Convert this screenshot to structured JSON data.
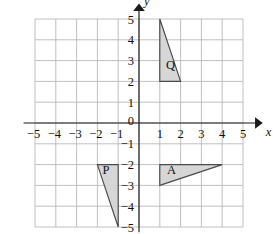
{
  "figure": {
    "kind": "coordinate-plane",
    "background_color": "#ffffff",
    "grid_color": "#b9b9bc",
    "axis_color": "#1b1b1b",
    "shape_fill_color": "#d3d3d3",
    "shape_stroke_color": "#4a4a4a"
  },
  "axes": {
    "x_axis_name": "x",
    "y_axis_name": "y",
    "origin_label": "0",
    "x_ticks": [
      {
        "value": -5,
        "label": "−5"
      },
      {
        "value": -4,
        "label": "−4"
      },
      {
        "value": -3,
        "label": "−3"
      },
      {
        "value": -2,
        "label": "−2"
      },
      {
        "value": -1,
        "label": "−1"
      },
      {
        "value": 1,
        "label": "1"
      },
      {
        "value": 2,
        "label": "2"
      },
      {
        "value": 3,
        "label": "3"
      },
      {
        "value": 4,
        "label": "4"
      },
      {
        "value": 5,
        "label": "5"
      }
    ],
    "y_ticks": [
      {
        "value": 5,
        "label": "5"
      },
      {
        "value": 4,
        "label": "4"
      },
      {
        "value": 3,
        "label": "3"
      },
      {
        "value": 2,
        "label": "2"
      },
      {
        "value": 1,
        "label": "1"
      },
      {
        "value": -1,
        "label": "−1"
      },
      {
        "value": -2,
        "label": "−2"
      },
      {
        "value": -3,
        "label": "−3"
      },
      {
        "value": -4,
        "label": "−4"
      },
      {
        "value": -5,
        "label": "−5"
      }
    ]
  },
  "chart_data": {
    "type": "scatter",
    "title": "",
    "xlabel": "x",
    "ylabel": "y",
    "xlim": [
      -5.6,
      5.9
    ],
    "ylim": [
      -5.4,
      5.6
    ],
    "grid": true,
    "legend": "none",
    "xticks": [
      -5,
      -4,
      -3,
      -2,
      -1,
      0,
      1,
      2,
      3,
      4,
      5
    ],
    "yticks": [
      -5,
      -4,
      -3,
      -2,
      -1,
      0,
      1,
      2,
      3,
      4,
      5
    ],
    "shapes": [
      {
        "name": "Q",
        "label": "Q",
        "type": "triangle",
        "vertices": [
          [
            1,
            5
          ],
          [
            1,
            2
          ],
          [
            2,
            2
          ]
        ],
        "label_position": [
          1.3,
          2.6
        ],
        "fill": "#d3d3d3",
        "stroke": "#4a4a4a"
      },
      {
        "name": "A",
        "label": "A",
        "type": "triangle",
        "vertices": [
          [
            1,
            -2
          ],
          [
            4,
            -2
          ],
          [
            1,
            -3
          ]
        ],
        "label_position": [
          1.35,
          -2.45
        ],
        "fill": "#d3d3d3",
        "stroke": "#4a4a4a"
      },
      {
        "name": "P",
        "label": "P",
        "type": "triangle",
        "vertices": [
          [
            -2,
            -2
          ],
          [
            -1,
            -2
          ],
          [
            -1,
            -5
          ]
        ],
        "label_position": [
          -1.75,
          -2.45
        ],
        "fill": "#d3d3d3",
        "stroke": "#4a4a4a"
      }
    ]
  }
}
